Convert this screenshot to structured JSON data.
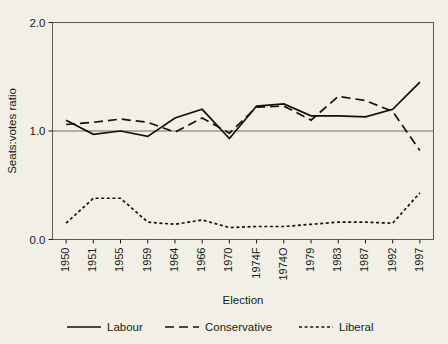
{
  "chart_data": {
    "type": "line",
    "title": "",
    "xlabel": "Election",
    "ylabel": "Seats:votes ratio",
    "categories": [
      "1950",
      "1951",
      "1955",
      "1959",
      "1964",
      "1966",
      "1970",
      "1974F",
      "1974O",
      "1979",
      "1983",
      "1987",
      "1992",
      "1997"
    ],
    "ylim": [
      0.0,
      2.0
    ],
    "yticks": [
      "0.0",
      "1.0",
      "2.0"
    ],
    "ytick_values": [
      0.0,
      1.0,
      2.0
    ],
    "grid": "horizontal-at-1.0",
    "legend_position": "bottom",
    "series": [
      {
        "name": "Labour",
        "style": "solid",
        "values": [
          1.1,
          0.97,
          1.0,
          0.95,
          1.12,
          1.2,
          0.93,
          1.23,
          1.25,
          1.14,
          1.14,
          1.13,
          1.2,
          1.45
        ]
      },
      {
        "name": "Conservative",
        "style": "dashed",
        "values": [
          1.06,
          1.08,
          1.11,
          1.08,
          0.99,
          1.12,
          0.98,
          1.22,
          1.23,
          1.1,
          1.32,
          1.28,
          1.18,
          0.82
        ]
      },
      {
        "name": "Liberal",
        "style": "dotted",
        "values": [
          0.15,
          0.38,
          0.38,
          0.16,
          0.14,
          0.18,
          0.11,
          0.12,
          0.12,
          0.14,
          0.16,
          0.16,
          0.15,
          0.43
        ]
      }
    ],
    "colors": {
      "line": "#111111",
      "frame": "#5a5a52",
      "grid": "#6b6b63",
      "background": "#f2f0e6",
      "text": "#1a1a18"
    }
  },
  "legend": {
    "items": [
      {
        "label": "Labour",
        "style": "solid"
      },
      {
        "label": "Conservative",
        "style": "dashed"
      },
      {
        "label": "Liberal",
        "style": "dotted"
      }
    ]
  },
  "axes": {
    "x_title": "Election",
    "y_title": "Seats:votes ratio"
  }
}
